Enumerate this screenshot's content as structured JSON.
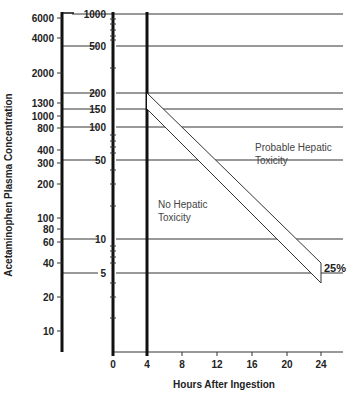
{
  "chart_data": {
    "type": "line",
    "title": "",
    "xlabel": "Hours After Ingestion",
    "ylabel": "Acetaminophen Plasma Concentration",
    "x_ticks": [
      "0",
      "4",
      "8",
      "12",
      "16",
      "20",
      "24"
    ],
    "xlim": [
      0,
      24
    ],
    "y_scale": "log",
    "y_axis_inner_ticks": [
      "1000",
      "500",
      "200",
      "150",
      "100",
      "50",
      "10",
      "5"
    ],
    "y_axis_outer_ticks": [
      "6000",
      "4000",
      "2000",
      "1300",
      "1000",
      "800",
      "400",
      "300",
      "200",
      "100",
      "80",
      "60",
      "40",
      "20",
      "10"
    ],
    "grid": true,
    "series": [
      {
        "name": "Treatment line (upper, 200 at 4h)",
        "x": [
          4,
          24
        ],
        "y": [
          200,
          6.25
        ]
      },
      {
        "name": "Treatment line (lower, 150 at 4h, 25% below)",
        "x": [
          4,
          24
        ],
        "y": [
          150,
          4.7
        ]
      }
    ],
    "annotations": [
      {
        "text": "Probable Hepatic Toxicity",
        "region": "above band"
      },
      {
        "text": "No Hepatic Toxicity",
        "region": "below band"
      },
      {
        "text": "25%",
        "position": "band end at 24h"
      }
    ]
  },
  "labels": {
    "xlabel": "Hours After Ingestion",
    "ylabel": "Acetaminophen Plasma Concentration",
    "probable_line1": "Probable Hepatic",
    "probable_line2": "Toxicity",
    "no_line1": "No Hepatic",
    "no_line2": "Toxicity",
    "pct": "25%"
  },
  "x_ticks": [
    {
      "label": "0",
      "x": 113
    },
    {
      "label": "4",
      "x": 147
    },
    {
      "label": "8",
      "x": 182
    },
    {
      "label": "12",
      "x": 217
    },
    {
      "label": "16",
      "x": 252
    },
    {
      "label": "20",
      "x": 287
    },
    {
      "label": "24",
      "x": 321
    }
  ],
  "inner_ticks": [
    {
      "label": "1000",
      "y": 14
    },
    {
      "label": "500",
      "y": 46
    },
    {
      "label": "200",
      "y": 93
    },
    {
      "label": "150",
      "y": 109
    },
    {
      "label": "100",
      "y": 127
    },
    {
      "label": "50",
      "y": 160
    },
    {
      "label": "10",
      "y": 239
    },
    {
      "label": "5",
      "y": 273
    }
  ],
  "outer_ticks": [
    {
      "label": "6000",
      "y": 18
    },
    {
      "label": "4000",
      "y": 38
    },
    {
      "label": "2000",
      "y": 73
    },
    {
      "label": "1300",
      "y": 103
    },
    {
      "label": "1000",
      "y": 116
    },
    {
      "label": "800",
      "y": 128
    },
    {
      "label": "400",
      "y": 150
    },
    {
      "label": "300",
      "y": 163
    },
    {
      "label": "200",
      "y": 184
    },
    {
      "label": "100",
      "y": 218
    },
    {
      "label": "80",
      "y": 229
    },
    {
      "label": "60",
      "y": 242
    },
    {
      "label": "40",
      "y": 263
    },
    {
      "label": "20",
      "y": 297
    },
    {
      "label": "10",
      "y": 331
    }
  ]
}
